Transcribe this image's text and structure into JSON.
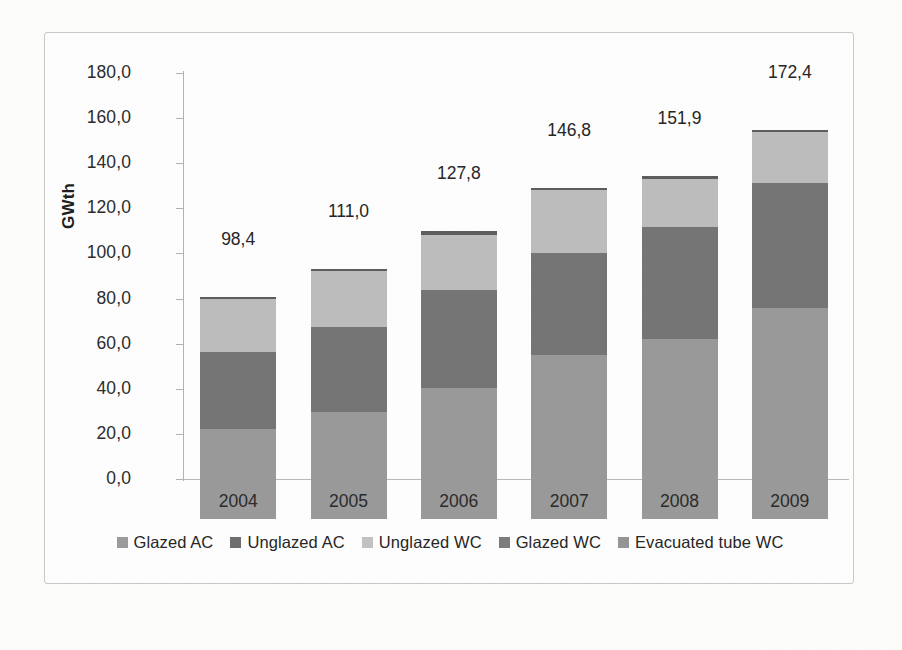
{
  "figure": {
    "background_color": "#fdfdfc",
    "plot_background_color": "#fefefe",
    "border_color": "#c9c9c9"
  },
  "chart_data": {
    "type": "bar",
    "subtype": "stacked-bar",
    "title": "",
    "xlabel": "",
    "ylabel": "GWth",
    "categories": [
      "2004",
      "2005",
      "2006",
      "2007",
      "2008",
      "2009"
    ],
    "ylim": [
      0,
      180
    ],
    "ytick_step": 20,
    "ytick_labels": [
      "0,0",
      "20,0",
      "40,0",
      "60,0",
      "80,0",
      "100,0",
      "120,0",
      "140,0",
      "160,0",
      "180,0"
    ],
    "ytick_values": [
      0,
      20,
      40,
      60,
      80,
      100,
      120,
      140,
      160,
      180
    ],
    "decimal_separator": ",",
    "grid": false,
    "legend_position": "bottom",
    "totals": [
      98.4,
      111.0,
      127.8,
      146.8,
      151.9,
      172.4
    ],
    "total_labels": [
      "98,4",
      "111,0",
      "127,8",
      "146,8",
      "151,9",
      "172,4"
    ],
    "series": [
      {
        "name": "Glazed WC",
        "color": "#9a9a9a",
        "stack_order": 1,
        "values": [
          40.0,
          47.5,
          58.0,
          72.5,
          80.0,
          93.5
        ]
      },
      {
        "name": "Unglazed WC",
        "color": "#767676",
        "stack_order": 2,
        "values": [
          34.0,
          37.5,
          43.5,
          45.5,
          49.5,
          55.5
        ]
      },
      {
        "name": "Unglazed AC",
        "color": "#bdbdbd",
        "stack_order": 3,
        "values": [
          23.4,
          25.0,
          24.3,
          27.8,
          21.4,
          22.4
        ]
      },
      {
        "name": "Glazed AC",
        "color": "#5e5e5e",
        "stack_order": 4,
        "values": [
          1.0,
          1.0,
          2.0,
          1.0,
          1.0,
          1.0
        ]
      },
      {
        "name": "Evacuated tube WC",
        "color": "#8a8a8a",
        "stack_order": 5,
        "values": [
          0.0,
          0.0,
          0.0,
          0.0,
          0.0,
          0.0
        ]
      }
    ],
    "legend_entries": [
      {
        "label": "Glazed AC",
        "color": "#9c9c9c"
      },
      {
        "label": "Unglazed AC",
        "color": "#6f6f6f"
      },
      {
        "label": "Unglazed WC",
        "color": "#c2c2c2"
      },
      {
        "label": "Glazed WC",
        "color": "#7d7d7d"
      },
      {
        "label": "Evacuated tube WC",
        "color": "#969696"
      }
    ]
  }
}
